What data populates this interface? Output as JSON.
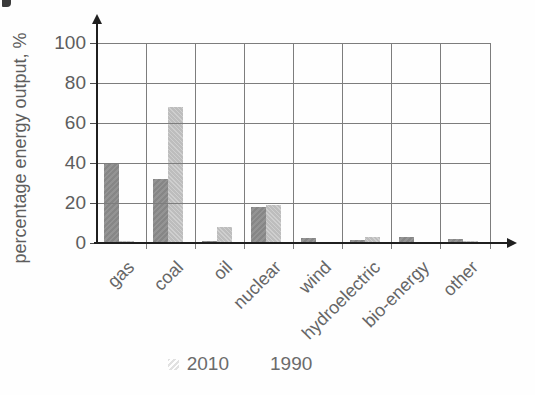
{
  "chart_data": {
    "type": "bar",
    "title": "",
    "xlabel": "",
    "ylabel": "percentage energy output, %",
    "categories": [
      "gas",
      "coal",
      "oil",
      "nuclear",
      "wind",
      "hydroelectric",
      "bio-energy",
      "other"
    ],
    "series": [
      {
        "name": "2010",
        "color": "#949494",
        "values": [
          40,
          32,
          1,
          18,
          2.5,
          1.5,
          3,
          2
        ]
      },
      {
        "name": "1990",
        "color": "#bdbdbd",
        "values": [
          1,
          68,
          8,
          19,
          0,
          3,
          0,
          1
        ]
      }
    ],
    "ylim": [
      0,
      100
    ],
    "y_ticks": [
      0,
      20,
      40,
      60,
      80,
      100
    ],
    "grid": true,
    "legend_position": "bottom"
  },
  "colors": {
    "grid": "#7d7d7d",
    "axis": "#1f1f1f",
    "text": "#5d5d5d",
    "series_2010": "#949494",
    "series_1990": "#bdbdbd"
  }
}
